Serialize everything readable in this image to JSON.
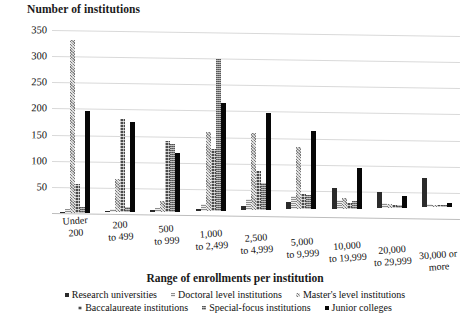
{
  "chart_data": {
    "type": "bar",
    "title": "",
    "ylabel": "Number of institutions",
    "xlabel": "Range of enrollments per institution",
    "ylim": [
      0,
      350
    ],
    "yticks": [
      50,
      100,
      150,
      200,
      250,
      300,
      350
    ],
    "grid": true,
    "legend_position": "bottom",
    "categories": [
      "Under 200",
      "200 to 499",
      "500 to 999",
      "1,000 to 2,499",
      "2,500 to 4,999",
      "5,000 to 9,999",
      "10,000 to 19,999",
      "20,000 to 29,999",
      "30,000 or more"
    ],
    "series": [
      {
        "name": "Research universities",
        "values": [
          2,
          2,
          3,
          4,
          7,
          13,
          40,
          30,
          55
        ]
      },
      {
        "name": "Doctoral level institutions",
        "values": [
          8,
          6,
          7,
          12,
          22,
          25,
          16,
          10,
          6
        ]
      },
      {
        "name": "Master's level institutions",
        "values": [
          330,
          63,
          20,
          150,
          148,
          120,
          20,
          8,
          4
        ]
      },
      {
        "name": "Baccalaureate institutions",
        "values": [
          55,
          178,
          135,
          118,
          75,
          30,
          10,
          5,
          3
        ]
      },
      {
        "name": "Special-focus institutions",
        "values": [
          12,
          10,
          130,
          290,
          52,
          28,
          14,
          6,
          3
        ]
      },
      {
        "name": "Junior colleges",
        "values": [
          195,
          172,
          112,
          207,
          185,
          150,
          78,
          22,
          8
        ]
      }
    ]
  },
  "xtick_labels": [
    {
      "line1": "Under",
      "line2": "200"
    },
    {
      "line1": "200",
      "line2": "to 499"
    },
    {
      "line1": "500",
      "line2": "to 999"
    },
    {
      "line1": "1,000",
      "line2": "to 2,499"
    },
    {
      "line1": "2,500",
      "line2": "to 4,999"
    },
    {
      "line1": "5,000",
      "line2": "to 9,999"
    },
    {
      "line1": "10,000",
      "line2": "to 19,999"
    },
    {
      "line1": "20,000",
      "line2": "to 29,999"
    },
    {
      "line1": "30,000 or",
      "line2": "more"
    }
  ],
  "ytick_labels": [
    "350",
    "300",
    "250",
    "200",
    "150",
    "100",
    "50"
  ],
  "legend_rows": [
    [
      {
        "label": "Research universities",
        "color": "#2b2b2b"
      },
      {
        "label": "Doctoral level institutions",
        "color": "#8f8f8f"
      },
      {
        "label": "Master's level institutions",
        "color": "#a8a8a8"
      }
    ],
    [
      {
        "label": "Baccalaureate institutions",
        "color": "#4a4a4a"
      },
      {
        "label": "Special-focus institutions",
        "color": "#6e6e6e"
      },
      {
        "label": "Junior colleges",
        "color": "#070707"
      }
    ]
  ]
}
